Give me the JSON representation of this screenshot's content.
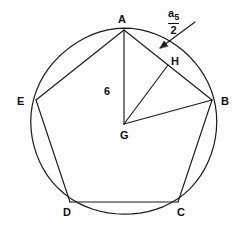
{
  "figure": {
    "type": "geometry-diagram",
    "stroke_color": "#1a1a1a",
    "background_color": "#fefefe",
    "circle": {
      "cx": 124,
      "cy": 122,
      "r": 93
    },
    "center_point": {
      "label": "G",
      "x": 124,
      "y": 124
    },
    "vertices": [
      {
        "label": "A",
        "x": 124,
        "y": 30,
        "label_x": 118,
        "label_y": 14
      },
      {
        "label": "B",
        "x": 212,
        "y": 100,
        "label_x": 221,
        "label_y": 96
      },
      {
        "label": "C",
        "x": 178,
        "y": 202,
        "label_x": 177,
        "label_y": 207
      },
      {
        "label": "D",
        "x": 70,
        "y": 202,
        "label_x": 63,
        "label_y": 207
      },
      {
        "label": "E",
        "x": 36,
        "y": 100,
        "label_x": 17,
        "label_y": 96
      }
    ],
    "midpoint": {
      "label": "H",
      "x": 168,
      "y": 65,
      "label_x": 171,
      "label_y": 56
    },
    "radius_label": {
      "text": "6",
      "x": 104,
      "y": 86
    },
    "side_half_label": {
      "numerator": "a",
      "numerator_subscript": "5",
      "denominator": "2",
      "x": 168,
      "y": 4
    },
    "arrow": {
      "from_x": 195,
      "from_y": 22,
      "to_x": 160,
      "to_y": 48
    },
    "segments": [
      {
        "name": "chord-A-E",
        "x1": 124,
        "y1": 30,
        "x2": 36,
        "y2": 100
      },
      {
        "name": "chord-A-B",
        "x1": 124,
        "y1": 30,
        "x2": 212,
        "y2": 100
      },
      {
        "name": "side-E-D",
        "x1": 36,
        "y1": 100,
        "x2": 70,
        "y2": 202
      },
      {
        "name": "side-D-C",
        "x1": 70,
        "y1": 202,
        "x2": 178,
        "y2": 202
      },
      {
        "name": "side-C-B",
        "x1": 178,
        "y1": 202,
        "x2": 212,
        "y2": 100
      },
      {
        "name": "radius-G-A",
        "x1": 124,
        "y1": 124,
        "x2": 124,
        "y2": 30
      },
      {
        "name": "radius-G-B",
        "x1": 124,
        "y1": 124,
        "x2": 212,
        "y2": 100
      },
      {
        "name": "apothem-G-H",
        "x1": 124,
        "y1": 124,
        "x2": 168,
        "y2": 65
      }
    ]
  }
}
